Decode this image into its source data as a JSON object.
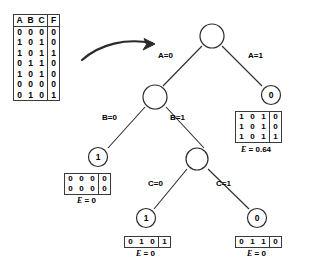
{
  "diagram": {
    "stroke_color": "#2b2b2b",
    "text_color": "#000000",
    "background": "#ffffff"
  },
  "truth_table": {
    "headers": [
      "A",
      "B",
      "C",
      "F"
    ],
    "rows": [
      [
        "0",
        "0",
        "0",
        "0"
      ],
      [
        "1",
        "0",
        "1",
        "0"
      ],
      [
        "1",
        "0",
        "1",
        "1"
      ],
      [
        "0",
        "1",
        "1",
        "0"
      ],
      [
        "1",
        "0",
        "1",
        "0"
      ],
      [
        "0",
        "0",
        "0",
        "0"
      ],
      [
        "0",
        "1",
        "0",
        "1"
      ]
    ]
  },
  "arrow": {
    "name": "curved-arrow",
    "label": ""
  },
  "tree": {
    "root": {
      "value": "",
      "name": "root-node"
    },
    "edges": [
      {
        "name": "edge-a-0",
        "label": "A=0"
      },
      {
        "name": "edge-a-1",
        "label": "A=1"
      },
      {
        "name": "edge-b-0",
        "label": "B=0"
      },
      {
        "name": "edge-b-1",
        "label": "B=1"
      },
      {
        "name": "edge-c-0",
        "label": "C=0"
      },
      {
        "name": "edge-c-1",
        "label": "C=1"
      }
    ],
    "nodes": {
      "a_split": "",
      "a1_leaf": "0",
      "b_split": "",
      "b0_leaf": "1",
      "c_split": "",
      "c0_leaf": "1",
      "c1_leaf": "0"
    }
  },
  "subtables": {
    "a1": {
      "name": "subtable-a1",
      "rows": [
        [
          "1",
          "0",
          "1",
          "0"
        ],
        [
          "1",
          "0",
          "1",
          "0"
        ],
        [
          "1",
          "0",
          "1",
          "1"
        ]
      ],
      "entropy_var": "E",
      "entropy_eq": "= 0.64"
    },
    "b0": {
      "name": "subtable-b0",
      "rows": [
        [
          "0",
          "0",
          "0",
          "0"
        ],
        [
          "0",
          "0",
          "0",
          "0"
        ]
      ],
      "entropy_var": "E",
      "entropy_eq": "= 0"
    },
    "c0": {
      "name": "subtable-c0",
      "rows": [
        [
          "0",
          "1",
          "0",
          "1"
        ]
      ],
      "entropy_var": "E",
      "entropy_eq": "= 0"
    },
    "c1": {
      "name": "subtable-c1",
      "rows": [
        [
          "0",
          "1",
          "1",
          "0"
        ]
      ],
      "entropy_var": "E",
      "entropy_eq": "= 0"
    }
  }
}
